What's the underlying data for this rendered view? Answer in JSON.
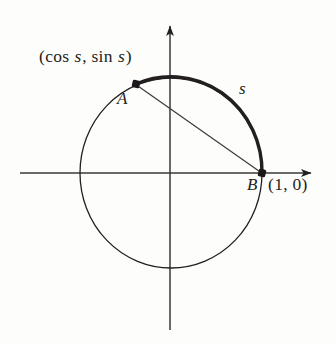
{
  "figure": {
    "kind": "unit-circle-arc-length-diagram",
    "background_color": "#fdfdfc",
    "ink_color": "#231f20",
    "labels": {
      "point_coords_open": "(cos ",
      "point_coords_var1": "s",
      "point_coords_mid": ", sin ",
      "point_coords_var2": "s",
      "point_coords_close": ")",
      "point_a": "A",
      "point_b": "B",
      "coord_one_zero": "(1, 0)",
      "arc_length": "s"
    }
  },
  "chart_data": {
    "type": "scatter",
    "title": "",
    "subtitle": "",
    "xlabel": "",
    "ylabel": "",
    "grid": false,
    "legend": "none",
    "axes": {
      "x_axis": {
        "y_pixel": 173,
        "x_start_pixel": 20,
        "x_end_pixel": 318,
        "arrow_at": "right",
        "label": ""
      },
      "y_axis": {
        "x_pixel": 170,
        "y_start_pixel": 19,
        "y_end_pixel": 330,
        "arrow_at": "top",
        "label": ""
      },
      "xlim": [
        -1.64,
        1.6
      ],
      "ylim": [
        -1.65,
        1.62
      ]
    },
    "circle": {
      "center_unit": [
        0,
        0
      ],
      "radius_unit": 1,
      "center_pixel": [
        171,
        173
      ],
      "rx_pixel": 91,
      "ry_pixel": 95,
      "stroke_width": 1.3,
      "stroke_color": "#231f20"
    },
    "points": [
      {
        "name": "A",
        "label": "A",
        "coords_label": "(cos s, sin s)",
        "unit": [
          -0.385,
          0.937
        ],
        "pixel": [
          136,
          84
        ],
        "marker": "filled-square-dot",
        "marker_size": 6
      },
      {
        "name": "B",
        "label": "B",
        "coords_label": "(1, 0)",
        "unit": [
          1,
          0
        ],
        "pixel": [
          262,
          173
        ],
        "marker": "filled-square-dot",
        "marker_size": 6
      }
    ],
    "arc": {
      "label": "s",
      "from_point": "B",
      "to_point": "A",
      "direction": "counterclockwise",
      "start_angle_deg": 0,
      "end_angle_deg": 112.4,
      "arc_length_unit": 1.962,
      "stroke_width": 3.4,
      "stroke_color": "#231f20",
      "label_pixel": [
        245,
        90
      ]
    },
    "chord": {
      "from_point": "A",
      "to_point": "B",
      "stroke_width": 1.2,
      "stroke_color": "#3d3a3b"
    }
  }
}
